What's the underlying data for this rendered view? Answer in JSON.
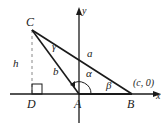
{
  "diagram": {
    "type": "triangle on coordinate axes",
    "points": {
      "C": {
        "label": "C"
      },
      "A": {
        "label": "A"
      },
      "B": {
        "label": "B",
        "coord_label": "(c, 0)"
      },
      "D": {
        "label": "D"
      }
    },
    "axes": {
      "x_label": "x",
      "y_label": "y"
    },
    "sides": {
      "a": "a",
      "b": "b",
      "h": "h"
    },
    "angles": {
      "alpha": "α",
      "beta": "β",
      "gamma": "γ"
    },
    "colors": {
      "stroke": "#1a1a1a",
      "dashed": "#888888",
      "background": "#ffffff"
    }
  }
}
